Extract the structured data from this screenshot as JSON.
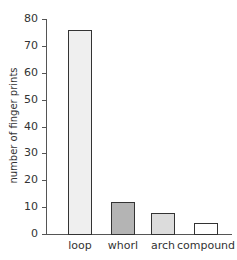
{
  "chart_data": {
    "type": "bar",
    "title": "",
    "xlabel": "",
    "ylabel": "number of finger prints",
    "categories": [
      "loop",
      "whorl",
      "arch",
      "compound"
    ],
    "values": [
      76,
      12,
      8,
      4
    ],
    "colors": [
      "#efefef",
      "#b4b4b4",
      "#dcdcdc",
      "#ffffff"
    ],
    "ylim": [
      0,
      80
    ],
    "yticks": [
      0,
      10,
      20,
      30,
      40,
      50,
      60,
      70,
      80
    ],
    "grid": false,
    "legend": null
  }
}
